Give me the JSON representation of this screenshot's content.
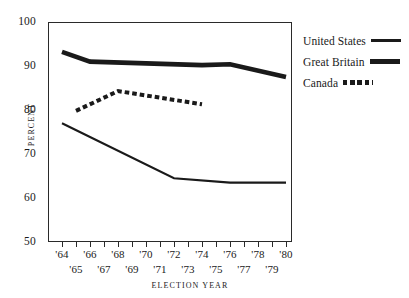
{
  "chart_data": {
    "type": "line",
    "title": "",
    "xlabel": "ELECTION YEAR",
    "ylabel": "PERCENT",
    "ylim": [
      50,
      100
    ],
    "xlim": [
      1964,
      1980
    ],
    "yticks": [
      50,
      60,
      70,
      80,
      90,
      100
    ],
    "ytick_labels": [
      "50",
      "60",
      "70",
      "80",
      "90",
      "100"
    ],
    "xticks": [
      1964,
      1965,
      1966,
      1967,
      1968,
      1969,
      1970,
      1971,
      1972,
      1973,
      1974,
      1975,
      1976,
      1977,
      1978,
      1979,
      1980
    ],
    "xtick_labels_even": [
      "'64",
      "'66",
      "'68",
      "'70",
      "'72",
      "'74",
      "'76",
      "'78",
      "'80"
    ],
    "xtick_labels_odd": [
      "'65",
      "'67",
      "'69",
      "'71",
      "'73",
      "'75",
      "'77",
      "'79"
    ],
    "xtick_values_even": [
      1964,
      1966,
      1968,
      1970,
      1972,
      1974,
      1976,
      1978,
      1980
    ],
    "xtick_values_odd": [
      1965,
      1967,
      1969,
      1971,
      1973,
      1975,
      1977,
      1979
    ],
    "grid": false,
    "legend_position": "right",
    "series": [
      {
        "name": "United States",
        "style": "solid-thin",
        "color": "#1a1a1a",
        "x": [
          1964,
          1972,
          1976,
          1980
        ],
        "values": [
          77.0,
          64.5,
          63.5,
          63.5
        ]
      },
      {
        "name": "Great Britain",
        "style": "solid-thick",
        "color": "#1a1a1a",
        "x": [
          1964,
          1966,
          1974,
          1976,
          1980
        ],
        "values": [
          93.2,
          91.0,
          90.2,
          90.4,
          87.5
        ]
      },
      {
        "name": "Canada",
        "style": "dashed",
        "color": "#1a1a1a",
        "x": [
          1965,
          1968,
          1974
        ],
        "values": [
          79.8,
          84.3,
          81.3
        ]
      }
    ]
  },
  "legend": {
    "items": [
      {
        "label": "United States",
        "swatch": "line-solid-thin-icon"
      },
      {
        "label": "Great Britain",
        "swatch": "line-solid-thick-icon"
      },
      {
        "label": "Canada",
        "swatch": "line-dashed-icon"
      }
    ]
  }
}
